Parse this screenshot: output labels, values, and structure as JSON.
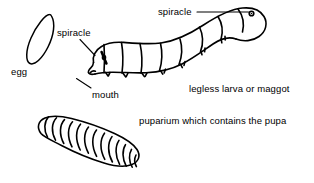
{
  "figure": {
    "background_color": "#ffffff",
    "ink_color": "#000000",
    "labels": {
      "egg": "egg",
      "spiracle_anterior": "spiracle",
      "spiracle_posterior": "spiracle",
      "mouth": "mouth",
      "larva": "legless larva or maggot",
      "puparium": "puparium which contains the pupa"
    },
    "parts": {
      "egg_shape": "egg-outline",
      "larva_shape": "maggot-outline",
      "puparium_shape": "puparium-outline",
      "leader_lines": [
        "spiracle-anterior-leader",
        "spiracle-posterior-leader",
        "mouth-leader"
      ]
    }
  }
}
